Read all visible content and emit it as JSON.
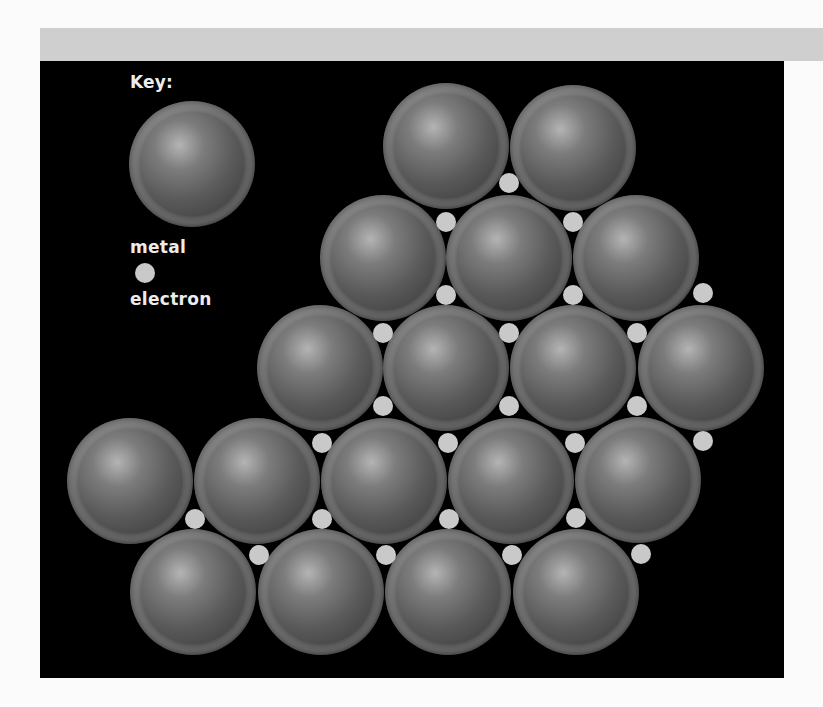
{
  "key": {
    "title": "Key:",
    "metal_label": "metal",
    "electron_label": "electron",
    "metal_sphere": {
      "cx": 192,
      "cy": 164,
      "r": 63
    },
    "electron_dot": {
      "cx": 145,
      "cy": 273,
      "r": 10
    }
  },
  "colors": {
    "page_background": "#fbfbfb",
    "top_bar": "#cfcfcf",
    "panel_background": "#000000",
    "metal_base": "#595959",
    "metal_highlight": "#b4b4b4",
    "metal_shadow": "#3e3e3e",
    "electron_fill": "#c9c9c9",
    "label_text": "#ececec"
  },
  "lattice": {
    "sphere_radius": 63,
    "electron_radius": 10,
    "metal_atoms": [
      {
        "row": 1,
        "cx": 446,
        "cy": 146
      },
      {
        "row": 1,
        "cx": 573,
        "cy": 148
      },
      {
        "row": 2,
        "cx": 383,
        "cy": 258
      },
      {
        "row": 2,
        "cx": 509,
        "cy": 258
      },
      {
        "row": 2,
        "cx": 636,
        "cy": 258
      },
      {
        "row": 3,
        "cx": 320,
        "cy": 368
      },
      {
        "row": 3,
        "cx": 446,
        "cy": 368
      },
      {
        "row": 3,
        "cx": 573,
        "cy": 368
      },
      {
        "row": 3,
        "cx": 701,
        "cy": 368
      },
      {
        "row": 4,
        "cx": 130,
        "cy": 481
      },
      {
        "row": 4,
        "cx": 257,
        "cy": 481
      },
      {
        "row": 4,
        "cx": 384,
        "cy": 481
      },
      {
        "row": 4,
        "cx": 511,
        "cy": 481
      },
      {
        "row": 4,
        "cx": 638,
        "cy": 480
      },
      {
        "row": 5,
        "cx": 193,
        "cy": 592
      },
      {
        "row": 5,
        "cx": 321,
        "cy": 592
      },
      {
        "row": 5,
        "cx": 448,
        "cy": 592
      },
      {
        "row": 5,
        "cx": 576,
        "cy": 592
      }
    ],
    "electrons": [
      {
        "cx": 509,
        "cy": 183
      },
      {
        "cx": 446,
        "cy": 222
      },
      {
        "cx": 573,
        "cy": 222
      },
      {
        "cx": 446,
        "cy": 295
      },
      {
        "cx": 573,
        "cy": 295
      },
      {
        "cx": 703,
        "cy": 293
      },
      {
        "cx": 383,
        "cy": 333
      },
      {
        "cx": 509,
        "cy": 333
      },
      {
        "cx": 637,
        "cy": 333
      },
      {
        "cx": 383,
        "cy": 406
      },
      {
        "cx": 509,
        "cy": 406
      },
      {
        "cx": 637,
        "cy": 406
      },
      {
        "cx": 322,
        "cy": 443
      },
      {
        "cx": 448,
        "cy": 443
      },
      {
        "cx": 575,
        "cy": 443
      },
      {
        "cx": 703,
        "cy": 441
      },
      {
        "cx": 195,
        "cy": 519
      },
      {
        "cx": 322,
        "cy": 519
      },
      {
        "cx": 449,
        "cy": 519
      },
      {
        "cx": 576,
        "cy": 518
      },
      {
        "cx": 259,
        "cy": 555
      },
      {
        "cx": 386,
        "cy": 555
      },
      {
        "cx": 512,
        "cy": 555
      },
      {
        "cx": 641,
        "cy": 554
      }
    ]
  }
}
